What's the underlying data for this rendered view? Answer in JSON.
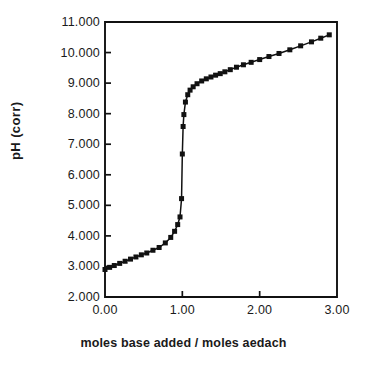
{
  "chart_data": {
    "type": "scatter",
    "title": "",
    "xlabel": "moles base added / moles aedach",
    "ylabel": "pH  (corr)",
    "xlim": [
      0.0,
      3.0
    ],
    "ylim": [
      2.0,
      11.0
    ],
    "grid": false,
    "legend": null,
    "xticks": [
      "0.00",
      "1.00",
      "2.00",
      "3.00"
    ],
    "xtick_values": [
      0.0,
      1.0,
      2.0,
      3.0
    ],
    "yticks": [
      "2.000",
      "3.000",
      "4.000",
      "5.000",
      "6.000",
      "7.000",
      "8.000",
      "9.000",
      "10.000",
      "11.000"
    ],
    "ytick_values": [
      2,
      3,
      4,
      5,
      6,
      7,
      8,
      9,
      10,
      11
    ],
    "marker": "square",
    "marker_color": "#111111",
    "line_color": "#111111",
    "series": [
      {
        "name": "titration",
        "x": [
          0.0,
          0.06,
          0.12,
          0.19,
          0.26,
          0.33,
          0.4,
          0.47,
          0.54,
          0.62,
          0.7,
          0.78,
          0.85,
          0.9,
          0.94,
          0.97,
          0.99,
          1.0,
          1.01,
          1.02,
          1.04,
          1.07,
          1.1,
          1.14,
          1.19,
          1.25,
          1.31,
          1.37,
          1.43,
          1.49,
          1.55,
          1.62,
          1.7,
          1.79,
          1.89,
          2.0,
          2.12,
          2.25,
          2.39,
          2.53,
          2.67,
          2.79,
          2.9
        ],
        "y": [
          2.9,
          2.97,
          3.03,
          3.1,
          3.17,
          3.24,
          3.31,
          3.38,
          3.44,
          3.53,
          3.62,
          3.77,
          3.95,
          4.15,
          4.37,
          4.62,
          5.22,
          6.68,
          7.58,
          7.97,
          8.38,
          8.62,
          8.77,
          8.88,
          8.98,
          9.07,
          9.14,
          9.2,
          9.26,
          9.31,
          9.37,
          9.44,
          9.52,
          9.6,
          9.68,
          9.77,
          9.87,
          9.97,
          10.09,
          10.22,
          10.35,
          10.47,
          10.58
        ]
      }
    ]
  },
  "axes": {
    "frame_color": "#111111"
  }
}
